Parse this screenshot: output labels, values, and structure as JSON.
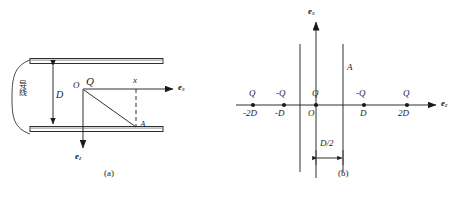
{
  "figure": {
    "caption_a": "(a)",
    "caption_b": "(b)"
  },
  "panel_a": {
    "name": "parallel-plate-waveguide-cross-section",
    "wire_label": "导线",
    "spacing_label": "D",
    "origin_label": "O",
    "source_charge_label": "Q",
    "distance_label": "x",
    "point_label": "A",
    "axis_x_label": "e",
    "axis_x_sub": "x",
    "axis_z_label": "e",
    "axis_z_sub": "z"
  },
  "panel_b": {
    "name": "image-charge-array",
    "axis_x_label": "e",
    "axis_x_sub": "x",
    "axis_z_label": "e",
    "axis_z_sub": "z",
    "origin_label": "O",
    "observation_label": "A",
    "gap_label": "D/2",
    "charges": [
      {
        "charge": "Q",
        "position": "-2D"
      },
      {
        "charge": "-Q",
        "position": "-D"
      },
      {
        "charge": "Q",
        "position": "O"
      },
      {
        "charge": "-Q",
        "position": "D"
      },
      {
        "charge": "Q",
        "position": "2D"
      }
    ]
  },
  "style": {
    "ink": "#1a1a1a",
    "paper": "#ffffff"
  }
}
